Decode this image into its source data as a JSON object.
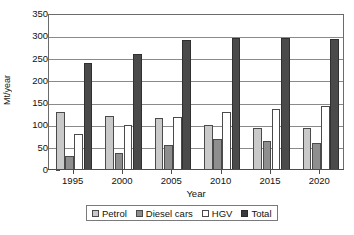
{
  "chart_data": {
    "type": "bar",
    "title": "",
    "xlabel": "Year",
    "ylabel": "Mt/year",
    "categories": [
      "1995",
      "2000",
      "2005",
      "2010",
      "2015",
      "2020"
    ],
    "series": [
      {
        "name": "Petrol",
        "values": [
          130,
          122,
          117,
          100,
          95,
          94
        ],
        "color": "#c9c9c9"
      },
      {
        "name": "Diesel cars",
        "values": [
          31,
          39,
          56,
          70,
          65,
          61
        ],
        "color": "#8e8e8e"
      },
      {
        "name": "HGV",
        "values": [
          80,
          101,
          120,
          130,
          137,
          144
        ],
        "color": "#ffffff"
      },
      {
        "name": "Total",
        "values": [
          240,
          261,
          291,
          296,
          296,
          294
        ],
        "color": "#4a4a4a"
      }
    ],
    "ylim": [
      0,
      350
    ],
    "ytick_values": [
      0,
      50,
      100,
      150,
      200,
      250,
      300,
      350
    ],
    "ytick_labels": [
      "0",
      "50",
      "100",
      "150",
      "200",
      "250",
      "300",
      "350"
    ],
    "grid": true,
    "legend_position": "bottom",
    "legend_entries": [
      "Petrol",
      "Diesel cars",
      "HGV",
      "Total"
    ]
  }
}
